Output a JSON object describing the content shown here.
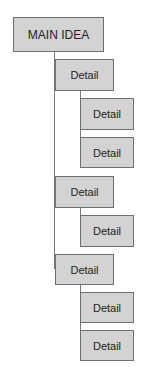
{
  "diagram": {
    "type": "indented-hierarchy",
    "main": {
      "label": "MAIN IDEA"
    },
    "groups": [
      {
        "label": "Detail",
        "children": [
          {
            "label": "Detail"
          },
          {
            "label": "Detail"
          }
        ]
      },
      {
        "label": "Detail",
        "children": [
          {
            "label": "Detail"
          }
        ]
      },
      {
        "label": "Detail",
        "children": [
          {
            "label": "Detail"
          },
          {
            "label": "Detail"
          }
        ]
      }
    ],
    "colors": {
      "box_fill": "#d3d3d3",
      "box_border": "#6f6f6f",
      "connector": "#7a7a7a",
      "text": "#222222"
    }
  }
}
